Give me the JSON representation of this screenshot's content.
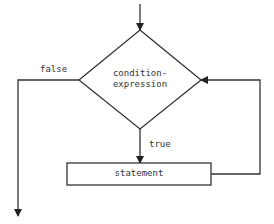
{
  "diagram": {
    "type": "flowchart",
    "colors": {
      "stroke": "#333333",
      "text": "#333333",
      "background": "#ffffff"
    },
    "nodes": [
      {
        "id": "condition",
        "shape": "diamond",
        "line1": "condition-",
        "line2": "expression"
      },
      {
        "id": "statement",
        "shape": "rectangle",
        "label": "statement"
      }
    ],
    "edges": [
      {
        "from": "entry",
        "to": "condition",
        "label": ""
      },
      {
        "from": "condition",
        "to": "statement",
        "label": "true"
      },
      {
        "from": "condition",
        "to": "exit",
        "label": "false"
      },
      {
        "from": "statement",
        "to": "condition",
        "label": ""
      }
    ],
    "labels": {
      "true": "true",
      "false": "false"
    }
  }
}
